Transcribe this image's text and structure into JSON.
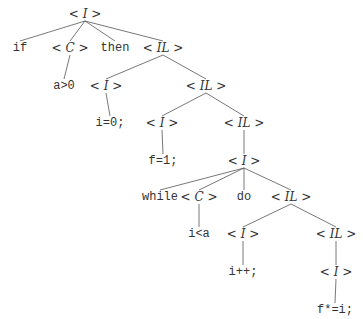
{
  "diagram": {
    "type": "parse-tree",
    "nodes": [
      {
        "id": "n0",
        "kind": "nonterminal",
        "label": "I",
        "x": 85,
        "y": 14
      },
      {
        "id": "n1",
        "kind": "terminal",
        "label": "if",
        "x": 20,
        "y": 48
      },
      {
        "id": "n2",
        "kind": "nonterminal",
        "label": "C",
        "x": 70,
        "y": 48
      },
      {
        "id": "n3",
        "kind": "terminal",
        "label": "then",
        "x": 115,
        "y": 48
      },
      {
        "id": "n4",
        "kind": "nonterminal",
        "label": "IL",
        "x": 163,
        "y": 48
      },
      {
        "id": "n5",
        "kind": "terminal",
        "label": "a>0",
        "x": 64,
        "y": 86
      },
      {
        "id": "n6",
        "kind": "nonterminal",
        "label": "I",
        "x": 106,
        "y": 86
      },
      {
        "id": "n7",
        "kind": "nonterminal",
        "label": "IL",
        "x": 206,
        "y": 86
      },
      {
        "id": "n8",
        "kind": "terminal",
        "label": "i=0;",
        "x": 110,
        "y": 123
      },
      {
        "id": "n9",
        "kind": "nonterminal",
        "label": "I",
        "x": 162,
        "y": 123
      },
      {
        "id": "n10",
        "kind": "nonterminal",
        "label": "IL",
        "x": 244,
        "y": 123
      },
      {
        "id": "n11",
        "kind": "terminal",
        "label": "f=1;",
        "x": 163,
        "y": 161
      },
      {
        "id": "n12",
        "kind": "nonterminal",
        "label": "I",
        "x": 244,
        "y": 161
      },
      {
        "id": "n13",
        "kind": "terminal",
        "label": "while",
        "x": 160,
        "y": 197
      },
      {
        "id": "n14",
        "kind": "nonterminal",
        "label": "C",
        "x": 199,
        "y": 197
      },
      {
        "id": "n15",
        "kind": "terminal",
        "label": "do",
        "x": 244,
        "y": 197
      },
      {
        "id": "n16",
        "kind": "nonterminal",
        "label": "IL",
        "x": 291,
        "y": 197
      },
      {
        "id": "n17",
        "kind": "terminal",
        "label": "i<a",
        "x": 199,
        "y": 234
      },
      {
        "id": "n18",
        "kind": "nonterminal",
        "label": "I",
        "x": 243,
        "y": 234
      },
      {
        "id": "n19",
        "kind": "nonterminal",
        "label": "IL",
        "x": 336,
        "y": 234
      },
      {
        "id": "n20",
        "kind": "terminal",
        "label": "i++;",
        "x": 243,
        "y": 272
      },
      {
        "id": "n21",
        "kind": "nonterminal",
        "label": "I",
        "x": 336,
        "y": 272
      },
      {
        "id": "n22",
        "kind": "terminal",
        "label": "f*=i;",
        "x": 335,
        "y": 310
      }
    ],
    "edges": [
      [
        "n0",
        "n1"
      ],
      [
        "n0",
        "n2"
      ],
      [
        "n0",
        "n3"
      ],
      [
        "n0",
        "n4"
      ],
      [
        "n2",
        "n5"
      ],
      [
        "n4",
        "n6"
      ],
      [
        "n4",
        "n7"
      ],
      [
        "n6",
        "n8"
      ],
      [
        "n7",
        "n9"
      ],
      [
        "n7",
        "n10"
      ],
      [
        "n9",
        "n11"
      ],
      [
        "n10",
        "n12"
      ],
      [
        "n12",
        "n13"
      ],
      [
        "n12",
        "n14"
      ],
      [
        "n12",
        "n15"
      ],
      [
        "n12",
        "n16"
      ],
      [
        "n14",
        "n17"
      ],
      [
        "n16",
        "n18"
      ],
      [
        "n16",
        "n19"
      ],
      [
        "n18",
        "n20"
      ],
      [
        "n19",
        "n21"
      ],
      [
        "n21",
        "n22"
      ]
    ],
    "style": {
      "line_color": "#555555",
      "text_color": "#333333"
    }
  }
}
